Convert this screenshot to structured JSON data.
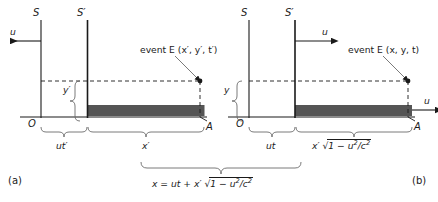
{
  "figure": {
    "type": "physics-diagram",
    "panels": [
      {
        "tag": "(a)",
        "frames": {
          "rest_frame": "S",
          "moving_frame": "S′"
        },
        "velocity_label": "u",
        "velocity_direction": "left",
        "event_label": "event E (x′, y′, t′)",
        "origin_label": "O",
        "point_label": "A",
        "vertical_label": "y′",
        "segment_left": "ut′",
        "segment_right": "x′"
      },
      {
        "tag": "(b)",
        "frames": {
          "rest_frame": "S",
          "moving_frame": "S′"
        },
        "velocity_label": "u",
        "velocity_direction": "right",
        "velocity_label_2": "u",
        "event_label": "event E (x, y, t)",
        "origin_label": "O",
        "point_label": "A",
        "vertical_label": "y",
        "segment_left": "ut",
        "segment_right_parts": {
          "prefix": "x′",
          "radical": "√",
          "radicand_lead": "1 − ",
          "numerator": "u",
          "num_sup": "2",
          "slash": "/",
          "denominator": "c",
          "den_sup": "2"
        },
        "total_equation_parts": {
          "lhs": "x = ut + x′",
          "radical": "√",
          "radicand_lead": "1 − ",
          "numerator": "u",
          "num_sup": "2",
          "slash": "/",
          "denominator": "c",
          "den_sup": "2"
        }
      }
    ],
    "colors": {
      "bar_fill": "#555555",
      "line": "#1a1a1a",
      "brace": "#6b6b6b",
      "dashed": "#1a1a1a"
    }
  }
}
